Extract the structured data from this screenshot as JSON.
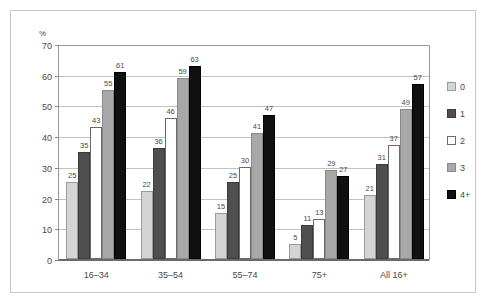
{
  "chart_data": {
    "type": "bar",
    "title": "",
    "subtitle": "",
    "xlabel": "",
    "ylabel": "%",
    "ylim": [
      0,
      70
    ],
    "ytick_step": 10,
    "yticks": [
      "70",
      "60",
      "50",
      "40",
      "30",
      "20",
      "10",
      "0"
    ],
    "grid": true,
    "legend_position": "right",
    "categories": [
      "16–34",
      "35–54",
      "55–74",
      "75+",
      "All 16+"
    ],
    "series": [
      {
        "name": "0",
        "color": "#d4d4d4",
        "border": "#9a9a9a",
        "values": [
          25,
          22,
          15,
          5,
          21
        ]
      },
      {
        "name": "1",
        "color": "#4f4f4f",
        "border": "#3a3a3a",
        "values": [
          35,
          36,
          25,
          11,
          31
        ]
      },
      {
        "name": "2",
        "color": "#ffffff",
        "border": "#6a6a6a",
        "values": [
          43,
          46,
          30,
          13,
          37
        ]
      },
      {
        "name": "3",
        "color": "#a8a8a8",
        "border": "#8a8a8a",
        "values": [
          55,
          59,
          41,
          29,
          49
        ]
      },
      {
        "name": "4+",
        "color": "#101010",
        "border": "#000000",
        "values": [
          61,
          63,
          47,
          27,
          57
        ]
      }
    ]
  },
  "legend": {
    "items": [
      {
        "label": "0"
      },
      {
        "label": "1"
      },
      {
        "label": "2"
      },
      {
        "label": "3"
      },
      {
        "label": "4+"
      }
    ]
  },
  "axis": {
    "unit_label": "%"
  }
}
